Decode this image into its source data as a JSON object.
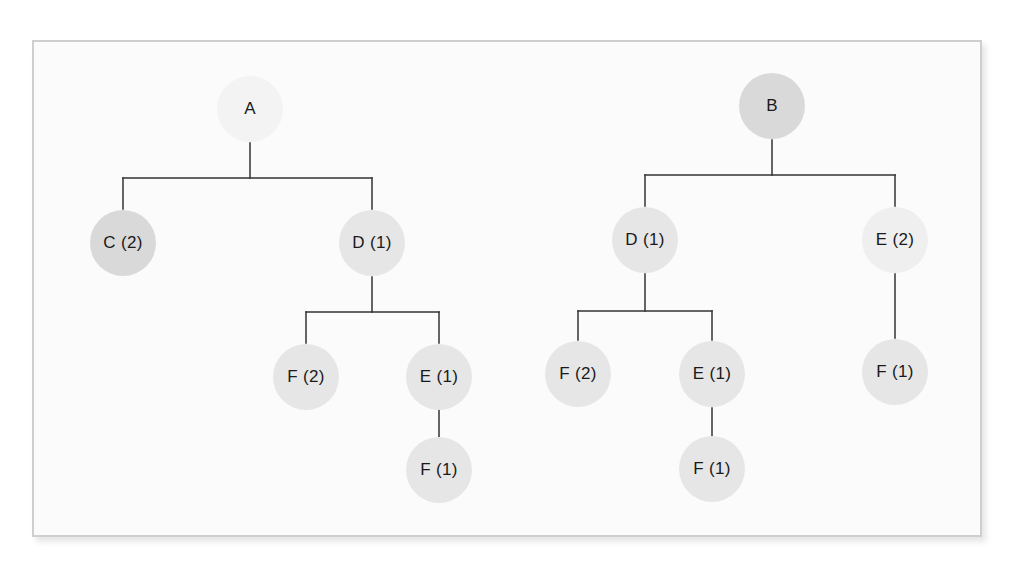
{
  "colors": {
    "background": "#ffffff",
    "frame_fill": "#fbfbfb",
    "frame_border": "#cfcfcf",
    "line": "#333333",
    "node_dark": "#d9d9d9",
    "node_mid": "#e6e6e6",
    "node_light": "#efefef",
    "node_lightest": "#f3f3f3",
    "text": "#1a1a1a"
  },
  "trees": [
    {
      "root": "A",
      "nodes": [
        {
          "id": "A",
          "label": "A",
          "x": 250,
          "y": 109,
          "shade": "node_lightest"
        },
        {
          "id": "C2",
          "label": "C (2)",
          "x": 123,
          "y": 243,
          "shade": "node_dark"
        },
        {
          "id": "D1",
          "label": "D (1)",
          "x": 372,
          "y": 243,
          "shade": "node_mid"
        },
        {
          "id": "F2",
          "label": "F (2)",
          "x": 306,
          "y": 377,
          "shade": "node_mid"
        },
        {
          "id": "E1",
          "label": "E (1)",
          "x": 439,
          "y": 377,
          "shade": "node_mid"
        },
        {
          "id": "F1",
          "label": "F (1)",
          "x": 439,
          "y": 470,
          "shade": "node_mid"
        }
      ],
      "edges": [
        {
          "from": "A",
          "to": "C2"
        },
        {
          "from": "A",
          "to": "D1"
        },
        {
          "from": "D1",
          "to": "F2"
        },
        {
          "from": "D1",
          "to": "E1"
        },
        {
          "from": "E1",
          "to": "F1"
        }
      ]
    },
    {
      "root": "B",
      "nodes": [
        {
          "id": "B",
          "label": "B",
          "x": 772,
          "y": 106,
          "shade": "node_dark"
        },
        {
          "id": "D1",
          "label": "D (1)",
          "x": 645,
          "y": 240,
          "shade": "node_mid"
        },
        {
          "id": "E2",
          "label": "E (2)",
          "x": 895,
          "y": 240,
          "shade": "node_light"
        },
        {
          "id": "F2",
          "label": "F (2)",
          "x": 578,
          "y": 374,
          "shade": "node_mid"
        },
        {
          "id": "E1",
          "label": "E (1)",
          "x": 712,
          "y": 374,
          "shade": "node_mid"
        },
        {
          "id": "F1a",
          "label": "F (1)",
          "x": 712,
          "y": 469,
          "shade": "node_mid"
        },
        {
          "id": "F1b",
          "label": "F (1)",
          "x": 895,
          "y": 372,
          "shade": "node_mid"
        }
      ],
      "edges": [
        {
          "from": "B",
          "to": "D1"
        },
        {
          "from": "B",
          "to": "E2"
        },
        {
          "from": "D1",
          "to": "F2"
        },
        {
          "from": "D1",
          "to": "E1"
        },
        {
          "from": "E1",
          "to": "F1a"
        },
        {
          "from": "E2",
          "to": "F1b"
        }
      ]
    }
  ],
  "connectors": [
    {
      "type": "v",
      "x": 250,
      "y1": 143,
      "y2": 178
    },
    {
      "type": "h",
      "y": 178,
      "x1": 123,
      "x2": 372
    },
    {
      "type": "v",
      "x": 123,
      "y1": 178,
      "y2": 209
    },
    {
      "type": "v",
      "x": 372,
      "y1": 178,
      "y2": 209
    },
    {
      "type": "v",
      "x": 372,
      "y1": 277,
      "y2": 312
    },
    {
      "type": "h",
      "y": 312,
      "x1": 306,
      "x2": 439
    },
    {
      "type": "v",
      "x": 306,
      "y1": 312,
      "y2": 343
    },
    {
      "type": "v",
      "x": 439,
      "y1": 312,
      "y2": 343
    },
    {
      "type": "v",
      "x": 439,
      "y1": 410,
      "y2": 437
    },
    {
      "type": "v",
      "x": 772,
      "y1": 140,
      "y2": 175
    },
    {
      "type": "h",
      "y": 175,
      "x1": 645,
      "x2": 895
    },
    {
      "type": "v",
      "x": 645,
      "y1": 175,
      "y2": 206
    },
    {
      "type": "v",
      "x": 895,
      "y1": 175,
      "y2": 206
    },
    {
      "type": "v",
      "x": 645,
      "y1": 274,
      "y2": 311
    },
    {
      "type": "h",
      "y": 311,
      "x1": 578,
      "x2": 712
    },
    {
      "type": "v",
      "x": 578,
      "y1": 311,
      "y2": 340
    },
    {
      "type": "v",
      "x": 712,
      "y1": 311,
      "y2": 340
    },
    {
      "type": "v",
      "x": 712,
      "y1": 408,
      "y2": 436
    },
    {
      "type": "v",
      "x": 895,
      "y1": 274,
      "y2": 338
    }
  ]
}
